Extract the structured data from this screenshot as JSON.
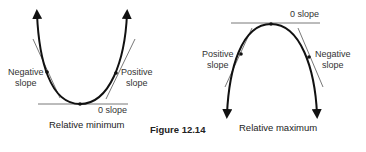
{
  "figure": {
    "caption": "Figure 12.14"
  },
  "left_diagram": {
    "title": "Relative minimum",
    "labels": {
      "left_point": [
        "Negative",
        "slope"
      ],
      "right_point": [
        "Positive",
        "slope"
      ],
      "bottom": "0 slope"
    }
  },
  "right_diagram": {
    "title": "Relative maximum",
    "labels": {
      "top": "0 slope",
      "left_point": [
        "Positive",
        "slope"
      ],
      "right_point": [
        "Negative",
        "slope"
      ]
    }
  },
  "colors": {
    "curve": "#111111",
    "tangent": "#555555",
    "text": "#333333"
  }
}
